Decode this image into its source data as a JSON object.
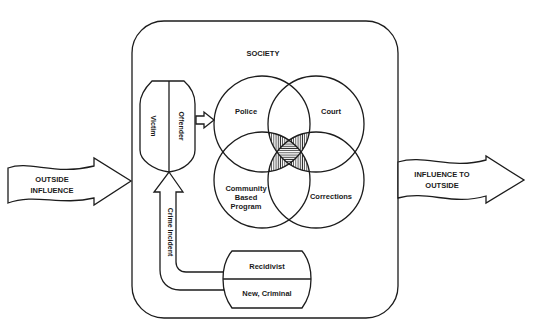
{
  "diagram": {
    "society_label": "SOCIETY",
    "outside_influence": {
      "line1": "OUTSIDE",
      "line2": "INFLUENCE"
    },
    "influence_to_outside": {
      "line1": "INFLUENCE TO",
      "line2": "OUTSIDE"
    },
    "victim_label": "Victim",
    "offender_label": "Offender",
    "crime_incident_label": "Crime Incident",
    "recidivist_label": "Recidivist",
    "new_criminal_label": "New, Criminal",
    "circles": {
      "police": "Police",
      "court": "Court",
      "community": {
        "line1": "Community",
        "line2": "Based",
        "line3": "Program"
      },
      "corrections": "Corrections"
    },
    "colors": {
      "ink": "#1c1c1c",
      "background": "#ffffff"
    }
  }
}
